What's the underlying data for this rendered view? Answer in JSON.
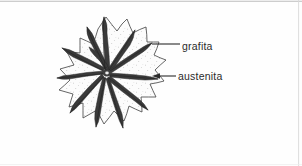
{
  "figure": {
    "background_color": "#fefefe",
    "border_color": "#d6d6d6",
    "ink_color": "#2b2b2b",
    "fill_color": "#fbfbfb",
    "speckle_color": "#9a9a9a"
  },
  "labels": {
    "graphite": "grafita",
    "austenite": "austenita"
  },
  "leaders": {
    "graphite_line": "leader-line-horizontal",
    "austenite_line": "leader-line-with-arrow"
  },
  "icons": {
    "arrow": "arrow-left-icon"
  }
}
